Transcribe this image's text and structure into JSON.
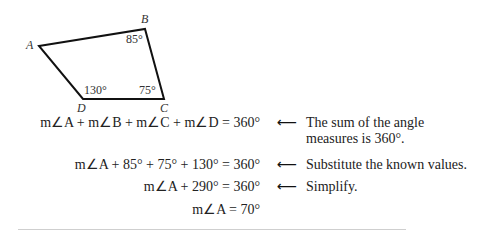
{
  "figure": {
    "vertices": {
      "A": {
        "label": "A",
        "x": 39,
        "y": 46
      },
      "B": {
        "label": "B",
        "x": 145,
        "y": 29
      },
      "C": {
        "label": "C",
        "x": 164,
        "y": 99
      },
      "D": {
        "label": "D",
        "x": 83,
        "y": 99
      }
    },
    "angles": {
      "B": "85°",
      "C": "75°",
      "D": "130°"
    },
    "stroke_color": "#111111"
  },
  "steps": [
    {
      "equation": "m∠A + m∠B + m∠C + m∠D = 360°",
      "note_line1": "The sum of the angle",
      "note_line2": "measures is 360°."
    },
    {
      "equation": "m∠A + 85° + 75° + 130° = 360°",
      "note_line1": "Substitute the known values.",
      "note_line2": ""
    },
    {
      "equation": "m∠A + 290° = 360°",
      "note_line1": "Simplify.",
      "note_line2": ""
    },
    {
      "equation": "m∠A = 70°",
      "note_line1": "",
      "note_line2": ""
    }
  ],
  "arrow_glyph": "⟵"
}
